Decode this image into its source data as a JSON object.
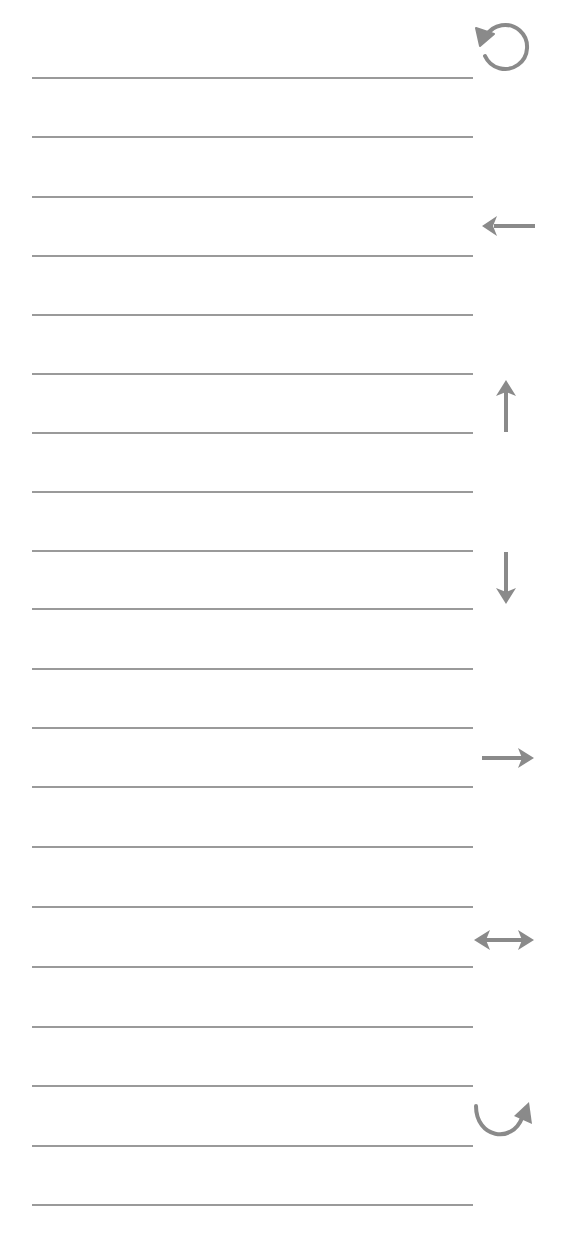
{
  "canvas": {
    "background": "#ffffff",
    "line_color": "#9a9a9a",
    "icon_color": "#8a8a8a",
    "line_count": 20,
    "line_left_px": 32,
    "line_width_px": 441,
    "line_y_positions": [
      77,
      136,
      196,
      255,
      314,
      373,
      432,
      491,
      550,
      608,
      668,
      727,
      786,
      846,
      906,
      966,
      1026,
      1085,
      1145,
      1204
    ]
  },
  "toolbar": {
    "items": [
      {
        "name": "rotate-counterclockwise",
        "icon": "rotate-ccw-icon",
        "glyph": "↺"
      },
      {
        "name": "arrow-left",
        "icon": "arrow-left-icon",
        "glyph": "←"
      },
      {
        "name": "arrow-up",
        "icon": "arrow-up-icon",
        "glyph": "↑"
      },
      {
        "name": "arrow-down",
        "icon": "arrow-down-icon",
        "glyph": "↓"
      },
      {
        "name": "arrow-right",
        "icon": "arrow-right-icon",
        "glyph": "→"
      },
      {
        "name": "arrow-left-right",
        "icon": "arrow-left-right-icon",
        "glyph": "↔"
      },
      {
        "name": "curved-arrow-up-right",
        "icon": "redo-curve-icon",
        "glyph": "↷"
      }
    ]
  }
}
